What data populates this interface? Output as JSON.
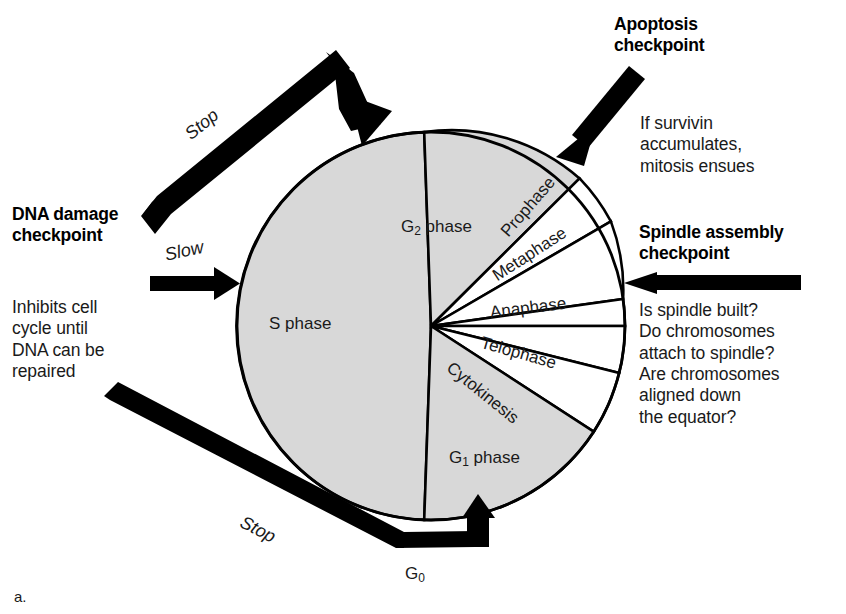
{
  "figure": {
    "caption": "a."
  },
  "cycle": {
    "center_x": 431,
    "center_y": 326,
    "radius": 194,
    "fill_interphase": "#d8d8d8",
    "fill_mitosis": "#ffffff",
    "stroke": "#000000",
    "slices": [
      {
        "name": "g2-phase",
        "label": "G₂ phase",
        "start_deg": 270,
        "end_deg": 320,
        "fill": "#d8d8d8",
        "label_x": 430,
        "label_y": 205,
        "rotate": 0
      },
      {
        "name": "prophase",
        "label": "Prophase",
        "start_deg": 320,
        "end_deg": 338,
        "fill": "#ffffff",
        "label_x": 510,
        "label_y": 262,
        "rotate": 49
      },
      {
        "name": "metaphase",
        "label": "Metaphase",
        "start_deg": 338,
        "end_deg": 352,
        "fill": "#ffffff",
        "label_x": 504,
        "label_y": 294,
        "rotate": 33
      },
      {
        "name": "anaphase",
        "label": "Anaphase",
        "start_deg": 352,
        "end_deg": 360,
        "fill": "#ffffff",
        "label_x": 516,
        "label_y": 316,
        "rotate": 8
      },
      {
        "name": "telophase",
        "label": "Telophase",
        "start_deg": 0,
        "end_deg": 14,
        "fill": "#ffffff",
        "label_x": 511,
        "label_y": 341,
        "rotate": -16
      },
      {
        "name": "cytokinesis",
        "label": "Cytokinesis",
        "start_deg": 14,
        "end_deg": 33,
        "fill": "#ffffff",
        "label_x": 492,
        "label_y": 365,
        "rotate": -39
      },
      {
        "name": "g1-phase",
        "label": "G₁ phase",
        "start_deg": 33,
        "end_deg": 92,
        "fill": "#d8d8d8",
        "label_x": 470,
        "label_y": 437,
        "rotate": 0
      },
      {
        "name": "s-phase",
        "label": "S phase",
        "start_deg": 92,
        "end_deg": 270,
        "fill": "#d8d8d8",
        "label_x": 300,
        "label_y": 324,
        "rotate": 0
      }
    ],
    "g0_label": "G₀"
  },
  "checkpoints": [
    {
      "id": "dna-damage",
      "title_line1": "DNA damage",
      "title_line2": "checkpoint",
      "note": "Inhibits cell\ncycle until\nDNA can be\nrepaired",
      "arrow_label": "Slow"
    },
    {
      "id": "apoptosis",
      "title_line1": "Apoptosis",
      "title_line2": "checkpoint",
      "note": "If survivin\naccumulates,\nmitosis ensues",
      "arrow_label": ""
    },
    {
      "id": "spindle-assembly",
      "title_line1": "Spindle assembly",
      "title_line2": "checkpoint",
      "note": "Is spindle built?\nDo chromosomes\nattach to spindle?\nAre chromosomes\naligned down\nthe equator?",
      "arrow_label": ""
    }
  ],
  "arrows": {
    "stop_top_label": "Stop",
    "stop_bottom_label": "Stop"
  },
  "colors": {
    "ink": "#000000",
    "interphase_gray": "#d8d8d8",
    "page": "#ffffff"
  }
}
